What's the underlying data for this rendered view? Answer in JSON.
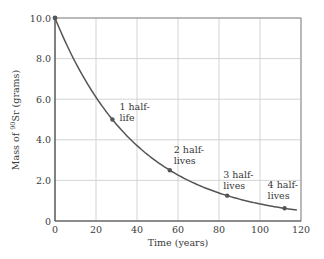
{
  "chart_data": {
    "type": "line",
    "title": "",
    "xlabel": "Time (years)",
    "ylabel_prefix": "Mass of ",
    "ylabel_isotope_mass_number": "90",
    "ylabel_element": "Sr",
    "ylabel_suffix": " (grams)",
    "ylabel": "Mass of 90Sr (grams)",
    "xlim": [
      0,
      120
    ],
    "ylim": [
      0,
      10
    ],
    "xticks": [
      0,
      20,
      40,
      60,
      80,
      100,
      120
    ],
    "xtick_labels": [
      "0",
      "20",
      "40",
      "60",
      "80",
      "100",
      "120"
    ],
    "yticks": [
      0,
      2,
      4,
      6,
      8,
      10
    ],
    "ytick_labels": [
      "0",
      "2.0",
      "4.0",
      "6.0",
      "8.0",
      "10.0"
    ],
    "grid": true,
    "legend": null,
    "series": [
      {
        "name": "Mass of 90Sr remaining",
        "model": "exponential decay m = 10 * 0.5^(t/28)",
        "initial_mass": 10.0,
        "half_life_years": 28,
        "x": [
          0,
          10,
          20,
          28,
          40,
          56,
          70,
          84,
          100,
          112,
          118
        ],
        "y": [
          10.0,
          7.8,
          6.1,
          5.0,
          3.7,
          2.5,
          1.77,
          1.25,
          0.84,
          0.625,
          0.54
        ]
      }
    ],
    "markers": [
      {
        "x": 0,
        "y": 10.0
      },
      {
        "x": 28,
        "y": 5.0
      },
      {
        "x": 56,
        "y": 2.5
      },
      {
        "x": 84,
        "y": 1.25
      },
      {
        "x": 112,
        "y": 0.625
      }
    ],
    "annotations": [
      {
        "line1": "1 half-",
        "line2": "life",
        "x": 28,
        "y": 5.0
      },
      {
        "line1": "2 half-",
        "line2": "lives",
        "x": 56,
        "y": 2.5
      },
      {
        "line1": "3 half-",
        "line2": "lives",
        "x": 84,
        "y": 1.25
      },
      {
        "line1": "4 half-",
        "line2": "lives",
        "x": 112,
        "y": 0.625
      }
    ]
  }
}
